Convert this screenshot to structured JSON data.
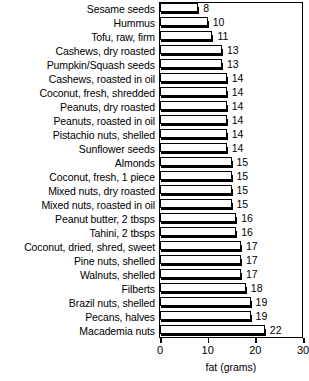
{
  "chart_data": {
    "type": "bar",
    "orientation": "horizontal",
    "title": "",
    "xlabel": "fat (grams)",
    "ylabel": "",
    "xlim": [
      0,
      30
    ],
    "xticks": [
      0,
      10,
      20,
      30
    ],
    "grid": false,
    "legend": null,
    "value_labels": true,
    "categories": [
      "Sesame seeds",
      "Hummus",
      "Tofu, raw, firm",
      "Cashews, dry roasted",
      "Pumpkin/Squash seeds",
      "Cashews, roasted in oil",
      "Coconut, fresh, shredded",
      "Peanuts, dry roasted",
      "Peanuts, roasted in oil",
      "Pistachio nuts, shelled",
      "Sunflower seeds",
      "Almonds",
      "Coconut, fresh, 1 piece",
      "Mixed nuts, dry roasted",
      "Mixed nuts, roasted in oil",
      "Peanut butter, 2 tbsps",
      "Tahini, 2 tbsps",
      "Coconut, dried, shred, sweet",
      "Pine nuts, shelled",
      "Walnuts, shelled",
      "Filberts",
      "Brazil nuts, shelled",
      "Pecans, halves",
      "Macademia nuts"
    ],
    "values": [
      8,
      10,
      11,
      13,
      13,
      14,
      14,
      14,
      14,
      14,
      14,
      15,
      15,
      15,
      15,
      16,
      16,
      17,
      17,
      17,
      18,
      19,
      19,
      22
    ]
  },
  "colors": {
    "bar_face": "#ffffff",
    "bar_shadow": "#000000",
    "axis": "#000000",
    "text": "#000000",
    "background": "#ffffff"
  }
}
